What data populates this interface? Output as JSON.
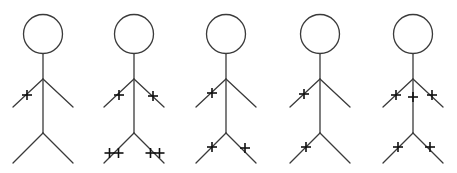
{
  "diagram": {
    "type": "stick-figure-series",
    "width": 457,
    "height": 173,
    "colors": {
      "background": "#ffffff",
      "line": "#3a3a3a",
      "mark": "#111111"
    },
    "figure_template": {
      "head_radius": 19.5,
      "head_cy": 34,
      "neck_y": 54,
      "shoulder_y": 79,
      "hand_y": 107,
      "hand_dx": 30,
      "hip_y": 133,
      "foot_y": 163,
      "foot_dx": 30
    },
    "figures": [
      {
        "id": "figure-1",
        "cx": 43,
        "marks": [
          {
            "part": "left-arm",
            "x": 27,
            "y": 95,
            "glyph": "+",
            "count": 1
          }
        ]
      },
      {
        "id": "figure-2",
        "cx": 134,
        "marks": [
          {
            "part": "left-arm",
            "x": 119,
            "y": 95,
            "glyph": "+",
            "count": 1
          },
          {
            "part": "right-arm",
            "x": 153,
            "y": 96,
            "glyph": "+",
            "count": 1
          },
          {
            "part": "left-leg",
            "x": 114,
            "y": 153,
            "glyph": "+",
            "count": 2
          },
          {
            "part": "right-leg",
            "x": 155,
            "y": 153,
            "glyph": "+",
            "count": 2
          }
        ]
      },
      {
        "id": "figure-3",
        "cx": 226,
        "marks": [
          {
            "part": "left-arm",
            "x": 212,
            "y": 93,
            "glyph": "+",
            "count": 1
          },
          {
            "part": "left-leg",
            "x": 212,
            "y": 147,
            "glyph": "+",
            "count": 1
          },
          {
            "part": "right-leg",
            "x": 245,
            "y": 148,
            "glyph": "+",
            "count": 1
          }
        ]
      },
      {
        "id": "figure-4",
        "cx": 320,
        "marks": [
          {
            "part": "left-arm",
            "x": 304,
            "y": 94,
            "glyph": "+",
            "count": 1
          },
          {
            "part": "left-leg",
            "x": 306,
            "y": 147,
            "glyph": "+",
            "count": 1
          }
        ]
      },
      {
        "id": "figure-5",
        "cx": 413,
        "marks": [
          {
            "part": "left-arm",
            "x": 396,
            "y": 95,
            "glyph": "+",
            "count": 1
          },
          {
            "part": "torso",
            "x": 413,
            "y": 97,
            "glyph": "+",
            "count": 1
          },
          {
            "part": "right-arm",
            "x": 432,
            "y": 95,
            "glyph": "+",
            "count": 1
          },
          {
            "part": "left-leg",
            "x": 398,
            "y": 147,
            "glyph": "+",
            "count": 1
          },
          {
            "part": "right-leg",
            "x": 430,
            "y": 147,
            "glyph": "+",
            "count": 1
          }
        ]
      }
    ]
  }
}
